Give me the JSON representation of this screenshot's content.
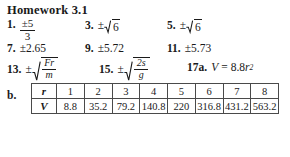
{
  "document": {
    "title": "Homework 3.1"
  },
  "answers": {
    "row1": [
      {
        "number": "1.",
        "type": "fraction",
        "numerator": "±5",
        "denominator": "3",
        "text": "±5/3"
      },
      {
        "number": "3.",
        "type": "sqrt",
        "sign": "±",
        "radicand": "6",
        "text": "±√6"
      },
      {
        "number": "5.",
        "type": "sqrt",
        "sign": "±",
        "radicand": "6",
        "text": "±√6"
      }
    ],
    "row2": [
      {
        "number": "7.",
        "type": "decimal",
        "text": "±2.65"
      },
      {
        "number": "9.",
        "type": "decimal",
        "text": "±5.72"
      },
      {
        "number": "11.",
        "type": "decimal",
        "text": "±5.73"
      }
    ],
    "row3": [
      {
        "number": "13.",
        "type": "sqrt-fraction",
        "sign": "±",
        "numerator": "Fr",
        "denominator": "m",
        "text": "±√(Fr/m)"
      },
      {
        "number": "15.",
        "type": "sqrt-fraction",
        "sign": "±",
        "numerator": "2s",
        "denominator": "g",
        "text": "±√(2s/g)"
      },
      {
        "number": "17a.",
        "type": "equation",
        "lhs": "V",
        "equals": "=",
        "coefficient": "8.8",
        "variable": "r",
        "exponent": "2",
        "text": "V = 8.8r²"
      }
    ]
  },
  "part_b": {
    "label": "b.",
    "table": {
      "row_labels": [
        "r",
        "V"
      ],
      "r_values": [
        "1",
        "2",
        "3",
        "4",
        "5",
        "6",
        "7",
        "8"
      ],
      "v_values": [
        "8.8",
        "35.2",
        "79.2",
        "140.8",
        "220",
        "316.8",
        "431.2",
        "563.2"
      ]
    }
  },
  "colors": {
    "background": "#ffffff",
    "text": "#1a1a1a",
    "table_border": "#4a4a4a"
  }
}
